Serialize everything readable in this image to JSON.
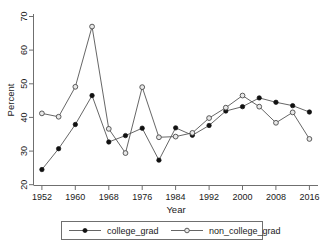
{
  "chart_data": {
    "type": "line",
    "title": "",
    "xlabel": "Year",
    "ylabel": "Percent",
    "x": [
      1952,
      1956,
      1960,
      1964,
      1968,
      1972,
      1976,
      1980,
      1984,
      1988,
      1992,
      1996,
      2000,
      2004,
      2008,
      2012,
      2016
    ],
    "xlim": [
      1950,
      2018
    ],
    "ylim": [
      20,
      70
    ],
    "xticks": [
      1952,
      1960,
      1968,
      1976,
      1984,
      1992,
      2000,
      2008,
      2016
    ],
    "yticks": [
      20,
      30,
      40,
      50,
      60,
      70
    ],
    "grid": false,
    "legend_position": "below",
    "series": [
      {
        "name": "college_grad",
        "marker": "filled-circle",
        "color": "#111111",
        "values": [
          24.5,
          30.7,
          37.9,
          46.5,
          32.7,
          34.6,
          36.8,
          27.3,
          36.9,
          34.7,
          37.6,
          41.9,
          43.2,
          45.8,
          44.5,
          43.5,
          41.6
        ]
      },
      {
        "name": "non_college_grad",
        "marker": "open-circle",
        "color": "#4a4a4a",
        "values": [
          41.2,
          40.2,
          49.1,
          67.0,
          36.6,
          29.4,
          49.0,
          34.1,
          34.3,
          35.4,
          39.8,
          42.9,
          46.5,
          43.2,
          38.4,
          41.5,
          33.6
        ]
      }
    ],
    "series_b_extra_note": ""
  },
  "legend": {
    "entries": [
      {
        "label": "college_grad",
        "marker": "filled-circle"
      },
      {
        "label": "non_college_grad",
        "marker": "open-circle"
      }
    ]
  },
  "axes": {
    "y_label": "Percent",
    "x_label": "Year",
    "y_tick_labels": [
      "20",
      "30",
      "40",
      "50",
      "60",
      "70"
    ],
    "x_tick_labels": [
      "1952",
      "1960",
      "1968",
      "1976",
      "1984",
      "1992",
      "2000",
      "2008",
      "2016"
    ]
  }
}
